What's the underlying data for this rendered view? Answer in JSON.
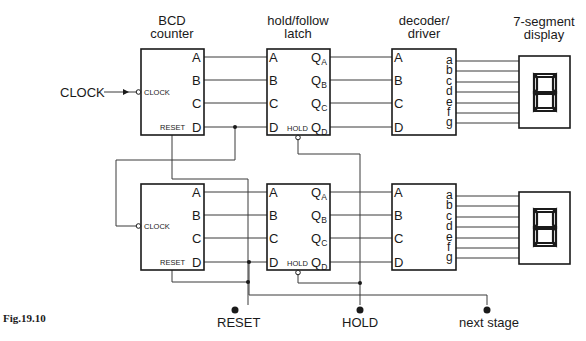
{
  "figure": {
    "caption": "Fig.19.10"
  },
  "headers": {
    "counter": [
      "BCD",
      "counter"
    ],
    "latch": [
      "hold/follow",
      "latch"
    ],
    "decoder": [
      "decoder/",
      "driver"
    ],
    "display": [
      "7-segment",
      "display"
    ]
  },
  "counter": {
    "outputs": [
      "A",
      "B",
      "C",
      "D"
    ],
    "clock_pin": "CLOCK",
    "reset_pin": "RESET"
  },
  "latch": {
    "inputs": [
      "A",
      "B",
      "C",
      "D"
    ],
    "outputs": [
      {
        "main": "Q",
        "sub": "A"
      },
      {
        "main": "Q",
        "sub": "B"
      },
      {
        "main": "Q",
        "sub": "C"
      },
      {
        "main": "Q",
        "sub": "D"
      }
    ],
    "hold_pin": "HOLD"
  },
  "decoder": {
    "inputs": [
      "A",
      "B",
      "C",
      "D"
    ],
    "outputs": [
      "a",
      "b",
      "c",
      "d",
      "e",
      "f",
      "g"
    ]
  },
  "signals": {
    "clock_input": "CLOCK",
    "reset": "RESET",
    "hold": "HOLD",
    "next_stage": "next stage"
  }
}
